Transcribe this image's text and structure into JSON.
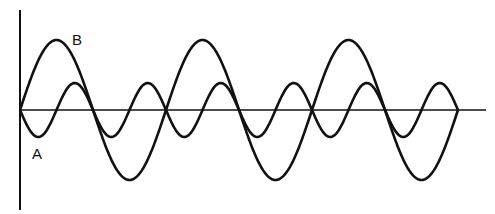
{
  "diagram": {
    "type": "waveform-comparison",
    "stroke_color": "#111111",
    "background": "#ffffff",
    "axes": {
      "origin_x": 20,
      "baseline_y": 110,
      "vertical_top": 10,
      "vertical_bottom": 210,
      "horizontal_end": 486
    },
    "waves": [
      {
        "name": "B",
        "label": "B",
        "amplitude_px": 70,
        "period_px": 146,
        "phase": "positive",
        "cycles": 3,
        "label_x": 72,
        "label_y": 32
      },
      {
        "name": "A",
        "label": "A",
        "amplitude_px": 27,
        "period_px": 73,
        "phase": "negative",
        "cycles": 6,
        "label_x": 32,
        "label_y": 146
      }
    ],
    "wave_start_x": 20,
    "wave_end_x": 458
  },
  "labels": {
    "wave_b": "B",
    "wave_a": "A"
  }
}
